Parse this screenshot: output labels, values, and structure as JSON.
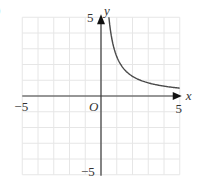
{
  "figure": {
    "corner_label": ")"
  },
  "chart_data": {
    "type": "line",
    "title": "",
    "xlabel": "x",
    "ylabel": "y",
    "xlim": [
      -5,
      5
    ],
    "ylim": [
      -5,
      5
    ],
    "grid": true,
    "grid_step": 1,
    "origin_label": "O",
    "tick_labels": {
      "x": [
        {
          "value": -5,
          "label": "−5"
        },
        {
          "value": 5,
          "label": "5"
        }
      ],
      "y": [
        {
          "value": 5,
          "label": "5"
        },
        {
          "value": -5,
          "label": "−5"
        }
      ]
    },
    "series": [
      {
        "name": "y = 2.5/x (x > 0)",
        "function": "2.5/x",
        "x": [
          0.5,
          0.75,
          1,
          1.5,
          2,
          2.5,
          3,
          3.5,
          4,
          4.5,
          5
        ],
        "values": [
          5,
          3.33,
          2.5,
          1.67,
          1.25,
          1.0,
          0.83,
          0.71,
          0.63,
          0.56,
          0.5
        ]
      }
    ],
    "colors": {
      "grid": "#e6e6e6",
      "axis": "#3a3a3a",
      "curve": "#4a4a4a",
      "text": "#333333"
    }
  }
}
